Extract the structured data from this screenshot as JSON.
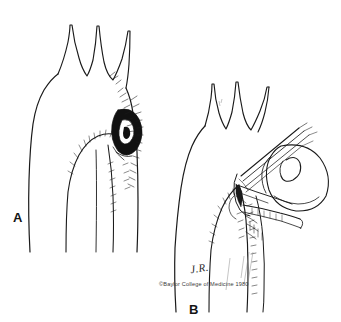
{
  "figure": {
    "type": "medical-line-illustration",
    "background_color": "#ffffff",
    "ink_color": "#1a1a1a",
    "panels": [
      {
        "id": "A",
        "label": "A",
        "label_position": {
          "x": 13,
          "y": 211
        },
        "description": "Aortic arch with three brachiocephalic branch vessels and a dark penetrating ulcer / atheromatous lesion on the descending aorta"
      },
      {
        "id": "B",
        "label": "B",
        "label_position": {
          "x": 189,
          "y": 303
        },
        "description": "Aortic arch with surgical clamp applied to the descending aorta and an everted sac / graft balloon held open with sutures"
      }
    ],
    "credit": {
      "symbol": "©",
      "institution": "Baylor College of Medicine",
      "year": "1980",
      "full_text": "©Baylor College of Medicine 1980"
    },
    "signature": {
      "initials": "J.R.",
      "meaning": "artist-signature"
    },
    "icons": {
      "aorta": "aorta-icon",
      "lesion": "dark-lesion-icon",
      "clamp": "surgical-clamp-icon",
      "sac": "graft-sac-icon",
      "sutures": "suture-lines-icon"
    }
  }
}
